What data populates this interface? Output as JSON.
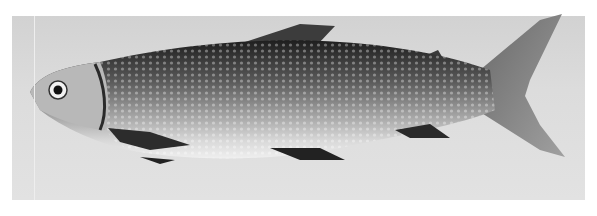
{
  "image": {
    "subject": "fish specimen photograph",
    "style": "black-and-white",
    "colors": {
      "page": "#ffffff",
      "background": "#d8d8d8",
      "body_dark": "#2a2a2a",
      "body_mid": "#7a7a7a",
      "belly": "#e8e8e8",
      "fin": "#4a4a4a"
    }
  }
}
